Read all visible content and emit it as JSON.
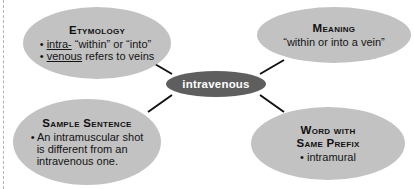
{
  "diagram": {
    "type": "word-web",
    "center": {
      "label": "intravenous"
    },
    "colors": {
      "bubble_fill": "#c2c2c2",
      "center_fill": "#5e5e5e",
      "center_text": "#ffffff",
      "connector": "#111111",
      "background": "#ffffff",
      "cut_line": "#b3b3b3"
    },
    "bubbles": {
      "etymology": {
        "title": "Etymology",
        "lines": [
          "• intra- “within” or “into”",
          "• venous refers to veins"
        ],
        "underlined_terms": [
          "intra-",
          "venous"
        ]
      },
      "meaning": {
        "title": "Meaning",
        "lines": [
          "“within or into a vein”"
        ]
      },
      "sample_sentence": {
        "title": "Sample Sentence",
        "lines": [
          "• An intramuscular shot",
          "is different from an",
          "intravenous one."
        ]
      },
      "word_same_prefix": {
        "title_line1": "Word with",
        "title_line2": "Same Prefix",
        "lines": [
          "• intramural"
        ]
      }
    }
  }
}
